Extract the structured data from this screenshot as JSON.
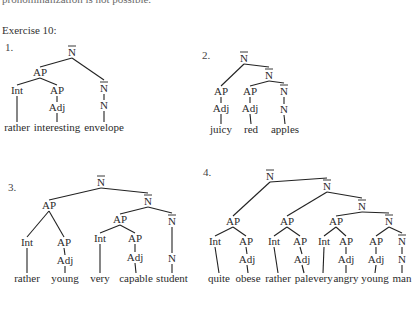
{
  "page": {
    "top_line": "pronominalization is not possible.",
    "heading": "Exercise 10:"
  },
  "trees": [
    {
      "number": "1.",
      "number_pos": [
        5,
        47
      ],
      "nodes": [
        {
          "id": "n0",
          "label": "N",
          "bar": true,
          "x": 72,
          "y": 56
        },
        {
          "id": "ap1",
          "label": "AP",
          "x": 40,
          "y": 76
        },
        {
          "id": "int1",
          "label": "Int",
          "x": 17,
          "y": 94
        },
        {
          "id": "ap2",
          "label": "AP",
          "x": 57,
          "y": 94
        },
        {
          "id": "adj1",
          "label": "Adj",
          "x": 57,
          "y": 111
        },
        {
          "id": "nb1",
          "label": "N",
          "bar": true,
          "x": 104,
          "y": 92
        },
        {
          "id": "n1",
          "label": "N",
          "x": 104,
          "y": 109
        },
        {
          "id": "w1",
          "label": "rather",
          "word": true,
          "x": 17,
          "y": 131
        },
        {
          "id": "w2",
          "label": "interesting",
          "word": true,
          "x": 57,
          "y": 131
        },
        {
          "id": "w3",
          "label": "envelope",
          "word": true,
          "x": 104,
          "y": 131
        }
      ],
      "edges": [
        [
          "n0",
          "ap1"
        ],
        [
          "n0",
          "nb1"
        ],
        [
          "ap1",
          "int1"
        ],
        [
          "ap1",
          "ap2"
        ],
        [
          "ap2",
          "adj1"
        ],
        [
          "nb1",
          "n1"
        ],
        [
          "int1",
          "w1"
        ],
        [
          "adj1",
          "w2"
        ],
        [
          "n1",
          "w3"
        ]
      ]
    },
    {
      "number": "2.",
      "number_pos": [
        202,
        55
      ],
      "nodes": [
        {
          "id": "n0",
          "label": "N",
          "bar": true,
          "x": 244,
          "y": 62
        },
        {
          "id": "ap1",
          "label": "AP",
          "x": 221,
          "y": 95
        },
        {
          "id": "adj1",
          "label": "Adj",
          "x": 221,
          "y": 112
        },
        {
          "id": "nb1",
          "label": "N",
          "bar": true,
          "x": 269,
          "y": 79
        },
        {
          "id": "ap2",
          "label": "AP",
          "x": 250,
          "y": 95
        },
        {
          "id": "adj2",
          "label": "Adj",
          "x": 250,
          "y": 112
        },
        {
          "id": "nb2",
          "label": "N",
          "bar": true,
          "x": 284,
          "y": 95
        },
        {
          "id": "n1",
          "label": "N",
          "x": 284,
          "y": 113
        },
        {
          "id": "w1",
          "label": "juicy",
          "word": true,
          "x": 221,
          "y": 133
        },
        {
          "id": "w2",
          "label": "red",
          "word": true,
          "x": 251,
          "y": 133
        },
        {
          "id": "w3",
          "label": "apples",
          "word": true,
          "x": 285,
          "y": 133
        }
      ],
      "edges": [
        [
          "n0",
          "ap1"
        ],
        [
          "n0",
          "nb1"
        ],
        [
          "ap1",
          "adj1"
        ],
        [
          "nb1",
          "ap2"
        ],
        [
          "nb1",
          "nb2"
        ],
        [
          "ap2",
          "adj2"
        ],
        [
          "nb2",
          "n1"
        ],
        [
          "adj1",
          "w1"
        ],
        [
          "adj2",
          "w2"
        ],
        [
          "n1",
          "w3"
        ]
      ]
    },
    {
      "number": "3.",
      "number_pos": [
        8,
        187
      ],
      "nodes": [
        {
          "id": "n0",
          "label": "N",
          "bar": true,
          "x": 101,
          "y": 186
        },
        {
          "id": "ap1",
          "label": "AP",
          "x": 49,
          "y": 209
        },
        {
          "id": "int1",
          "label": "Int",
          "x": 27,
          "y": 246
        },
        {
          "id": "ap2",
          "label": "AP",
          "x": 64,
          "y": 246
        },
        {
          "id": "adj1",
          "label": "Adj",
          "x": 65,
          "y": 264
        },
        {
          "id": "nb1",
          "label": "N",
          "bar": true,
          "x": 148,
          "y": 205
        },
        {
          "id": "ap3",
          "label": "AP",
          "x": 120,
          "y": 223
        },
        {
          "id": "int2",
          "label": "Int",
          "x": 100,
          "y": 242
        },
        {
          "id": "ap4",
          "label": "AP",
          "x": 135,
          "y": 242
        },
        {
          "id": "adj2",
          "label": "Adj",
          "x": 135,
          "y": 261
        },
        {
          "id": "nb2",
          "label": "N",
          "bar": true,
          "x": 172,
          "y": 225
        },
        {
          "id": "n1",
          "label": "N",
          "x": 172,
          "y": 262
        },
        {
          "id": "w1",
          "label": "rather",
          "word": true,
          "x": 27,
          "y": 282
        },
        {
          "id": "w2",
          "label": "young",
          "word": true,
          "x": 65,
          "y": 282
        },
        {
          "id": "w3",
          "label": "very",
          "word": true,
          "x": 100,
          "y": 282
        },
        {
          "id": "w4",
          "label": "capable",
          "word": true,
          "x": 136,
          "y": 282
        },
        {
          "id": "w5",
          "label": "student",
          "word": true,
          "x": 172,
          "y": 282
        }
      ],
      "edges": [
        [
          "n0",
          "ap1"
        ],
        [
          "n0",
          "nb1"
        ],
        [
          "ap1",
          "int1"
        ],
        [
          "ap1",
          "ap2"
        ],
        [
          "ap2",
          "adj1"
        ],
        [
          "nb1",
          "ap3"
        ],
        [
          "nb1",
          "nb2"
        ],
        [
          "ap3",
          "int2"
        ],
        [
          "ap3",
          "ap4"
        ],
        [
          "ap4",
          "adj2"
        ],
        [
          "nb2",
          "n1"
        ],
        [
          "int1",
          "w1"
        ],
        [
          "adj1",
          "w2"
        ],
        [
          "int2",
          "w3"
        ],
        [
          "adj2",
          "w4"
        ],
        [
          "n1",
          "w5"
        ]
      ]
    },
    {
      "number": "4.",
      "number_pos": [
        203,
        172
      ],
      "nodes": [
        {
          "id": "n0",
          "label": "N",
          "bar": true,
          "x": 270,
          "y": 180
        },
        {
          "id": "ap1",
          "label": "AP",
          "x": 233,
          "y": 225
        },
        {
          "id": "int1",
          "label": "Int",
          "x": 215,
          "y": 245
        },
        {
          "id": "ap2",
          "label": "AP",
          "x": 246,
          "y": 245
        },
        {
          "id": "adj1",
          "label": "Adj",
          "x": 247,
          "y": 263
        },
        {
          "id": "nb1",
          "label": "N",
          "bar": true,
          "x": 327,
          "y": 190
        },
        {
          "id": "ap3",
          "label": "AP",
          "x": 287,
          "y": 225
        },
        {
          "id": "int2",
          "label": "Int",
          "x": 274,
          "y": 245
        },
        {
          "id": "ap4",
          "label": "AP",
          "x": 300,
          "y": 245
        },
        {
          "id": "adj2",
          "label": "Adj",
          "x": 302,
          "y": 263
        },
        {
          "id": "nb2",
          "label": "N",
          "bar": true,
          "x": 362,
          "y": 210
        },
        {
          "id": "ap5",
          "label": "AP",
          "x": 336,
          "y": 225
        },
        {
          "id": "int3",
          "label": "Int",
          "x": 324,
          "y": 245
        },
        {
          "id": "ap6",
          "label": "AP",
          "x": 346,
          "y": 245
        },
        {
          "id": "adj3",
          "label": "Adj",
          "x": 346,
          "y": 263
        },
        {
          "id": "nb3",
          "label": "N",
          "bar": true,
          "x": 389,
          "y": 225
        },
        {
          "id": "ap7",
          "label": "AP",
          "x": 376,
          "y": 245
        },
        {
          "id": "adj4",
          "label": "Adj",
          "x": 376,
          "y": 263
        },
        {
          "id": "nb4",
          "label": "N",
          "bar": true,
          "x": 402,
          "y": 245
        },
        {
          "id": "n1",
          "label": "N",
          "x": 402,
          "y": 263
        },
        {
          "id": "w1",
          "label": "quite",
          "word": true,
          "x": 219,
          "y": 282
        },
        {
          "id": "w2",
          "label": "obese",
          "word": true,
          "x": 248,
          "y": 282
        },
        {
          "id": "w3",
          "label": "rather",
          "word": true,
          "x": 278,
          "y": 282
        },
        {
          "id": "w4",
          "label": "pale",
          "word": true,
          "x": 304,
          "y": 282
        },
        {
          "id": "w5",
          "label": "very",
          "word": true,
          "x": 323,
          "y": 282
        },
        {
          "id": "w6",
          "label": "angry",
          "word": true,
          "x": 346,
          "y": 282
        },
        {
          "id": "w7",
          "label": "young",
          "word": true,
          "x": 375,
          "y": 282
        },
        {
          "id": "w8",
          "label": "man",
          "word": true,
          "x": 402,
          "y": 282
        }
      ],
      "edges": [
        [
          "n0",
          "ap1"
        ],
        [
          "n0",
          "nb1"
        ],
        [
          "ap1",
          "int1"
        ],
        [
          "ap1",
          "ap2"
        ],
        [
          "ap2",
          "adj1"
        ],
        [
          "nb1",
          "ap3"
        ],
        [
          "nb1",
          "nb2"
        ],
        [
          "ap3",
          "int2"
        ],
        [
          "ap3",
          "ap4"
        ],
        [
          "ap4",
          "adj2"
        ],
        [
          "nb2",
          "ap5"
        ],
        [
          "nb2",
          "nb3"
        ],
        [
          "ap5",
          "int3"
        ],
        [
          "ap5",
          "ap6"
        ],
        [
          "ap6",
          "adj3"
        ],
        [
          "nb3",
          "ap7"
        ],
        [
          "nb3",
          "nb4"
        ],
        [
          "ap7",
          "adj4"
        ],
        [
          "nb4",
          "n1"
        ],
        [
          "int1",
          "w1"
        ],
        [
          "adj1",
          "w2"
        ],
        [
          "int2",
          "w3"
        ],
        [
          "adj2",
          "w4"
        ],
        [
          "int3",
          "w5"
        ],
        [
          "adj3",
          "w6"
        ],
        [
          "adj4",
          "w7"
        ],
        [
          "n1",
          "w8"
        ]
      ]
    }
  ]
}
